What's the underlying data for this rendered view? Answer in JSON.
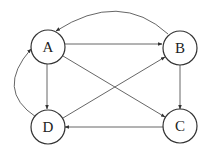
{
  "diagram": {
    "type": "directed-graph",
    "nodes": [
      {
        "id": "A",
        "label": "A",
        "cx": 48,
        "cy": 47
      },
      {
        "id": "B",
        "label": "B",
        "cx": 180,
        "cy": 48
      },
      {
        "id": "C",
        "label": "C",
        "cx": 180,
        "cy": 126
      },
      {
        "id": "D",
        "label": "D",
        "cx": 48,
        "cy": 127
      }
    ],
    "edges": [
      {
        "from": "A",
        "to": "B",
        "shape": "straight"
      },
      {
        "from": "B",
        "to": "A",
        "shape": "curved-top"
      },
      {
        "from": "A",
        "to": "D",
        "shape": "straight"
      },
      {
        "from": "D",
        "to": "A",
        "shape": "curved-left"
      },
      {
        "from": "A",
        "to": "C",
        "shape": "straight"
      },
      {
        "from": "D",
        "to": "B",
        "shape": "straight"
      },
      {
        "from": "B",
        "to": "C",
        "shape": "straight"
      },
      {
        "from": "C",
        "to": "D",
        "shape": "straight"
      }
    ],
    "node_radius": 17,
    "colors": {
      "stroke": "#333333",
      "edge": "#555555",
      "background": "#ffffff"
    }
  }
}
